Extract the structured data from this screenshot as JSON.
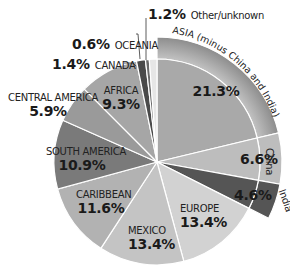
{
  "chart_data": {
    "type": "pie",
    "title": "",
    "start_angle_deg": 0,
    "direction": "clockwise",
    "slices": [
      {
        "label": "ASIA (minus China and India)",
        "value": 21.3,
        "color": "#a9a9a9",
        "group": "asia"
      },
      {
        "label": "China",
        "value": 6.6,
        "color": "#bdbdbd",
        "group": "asia"
      },
      {
        "label": "India",
        "value": 4.6,
        "color": "#555555",
        "group": "asia"
      },
      {
        "label": "EUROPE",
        "value": 13.4,
        "color": "#d2d2d2"
      },
      {
        "label": "MEXICO",
        "value": 13.4,
        "color": "#c4c4c4"
      },
      {
        "label": "CARIBBEAN",
        "value": 11.6,
        "color": "#b2b2b2"
      },
      {
        "label": "SOUTH AMERICA",
        "value": 10.9,
        "color": "#7a7a7a"
      },
      {
        "label": "CENTRAL AMERICA",
        "value": 5.9,
        "color": "#9a9a9a"
      },
      {
        "label": "AFRICA",
        "value": 9.3,
        "color": "#a6a6a6"
      },
      {
        "label": "CANADA",
        "value": 1.4,
        "color": "#4a4a4a"
      },
      {
        "label": "OCEANIA",
        "value": 0.6,
        "color": "#6a6a6a"
      },
      {
        "label": "Other/unknown",
        "value": 1.2,
        "color": "#e6e6e6"
      }
    ],
    "outer_ring": {
      "label": "ASIA (minus China and India)",
      "members": [
        "ASIA (minus China and India)",
        "China",
        "India"
      ],
      "total": 32.5
    }
  },
  "labels": {
    "asia_ring": "ASIA (minus China and India)",
    "asia_pct": "21.3%",
    "china_name": "China",
    "china_pct": "6.6%",
    "india_name": "India",
    "india_pct": "4.6%",
    "europe_name": "EUROPE",
    "europe_pct": "13.4%",
    "mexico_name": "MEXICO",
    "mexico_pct": "13.4%",
    "caribbean_name": "CARIBBEAN",
    "caribbean_pct": "11.6%",
    "south_america_name": "SOUTH AMERICA",
    "south_america_pct": "10.9%",
    "central_america_name": "CENTRAL AMERICA",
    "central_america_pct": "5.9%",
    "africa_name": "AFRICA",
    "africa_pct": "9.3%",
    "canada_name": "CANADA",
    "canada_pct": "1.4%",
    "oceania_name": "OCEANIA",
    "oceania_pct": "0.6%",
    "other_name": "Other/unknown",
    "other_pct": "1.2%"
  }
}
